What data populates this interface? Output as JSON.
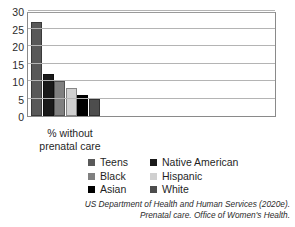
{
  "chart_data": {
    "type": "bar",
    "title": "",
    "subtitle": "",
    "xlabel": "% without prenatal care",
    "ylabel": "",
    "categories": [
      "% without prenatal care"
    ],
    "ylim": [
      0,
      30
    ],
    "yticks": [
      0,
      5,
      10,
      15,
      20,
      25,
      30
    ],
    "ytick_labels": [
      "0",
      "5",
      "10",
      "15",
      "20",
      "25",
      "30"
    ],
    "grid": true,
    "legend_position": "below-plot",
    "series": [
      {
        "name": "Teens",
        "values": [
          27
        ],
        "color": "#595959"
      },
      {
        "name": "Native American",
        "values": [
          12
        ],
        "color": "#1a1a1a"
      },
      {
        "name": "Black",
        "values": [
          10
        ],
        "color": "#808080"
      },
      {
        "name": "Hispanic",
        "values": [
          8
        ],
        "color": "#d0d0d0"
      },
      {
        "name": "Asian",
        "values": [
          6
        ],
        "color": "#000000"
      },
      {
        "name": "White",
        "values": [
          5
        ],
        "color": "#4d4d4d"
      }
    ]
  },
  "axis": {
    "x_caption_line1": "% without",
    "x_caption_line2": "prenatal care"
  },
  "legend": {
    "rows": [
      {
        "left": "Teens",
        "right": "Native American"
      },
      {
        "left": "Black",
        "right": "Hispanic"
      },
      {
        "left": "Asian",
        "right": "White"
      }
    ]
  },
  "citation": {
    "line1": "US Department of Health and Human Services (2020e).",
    "line2": "Prenatal care. Office of Women's Health."
  }
}
